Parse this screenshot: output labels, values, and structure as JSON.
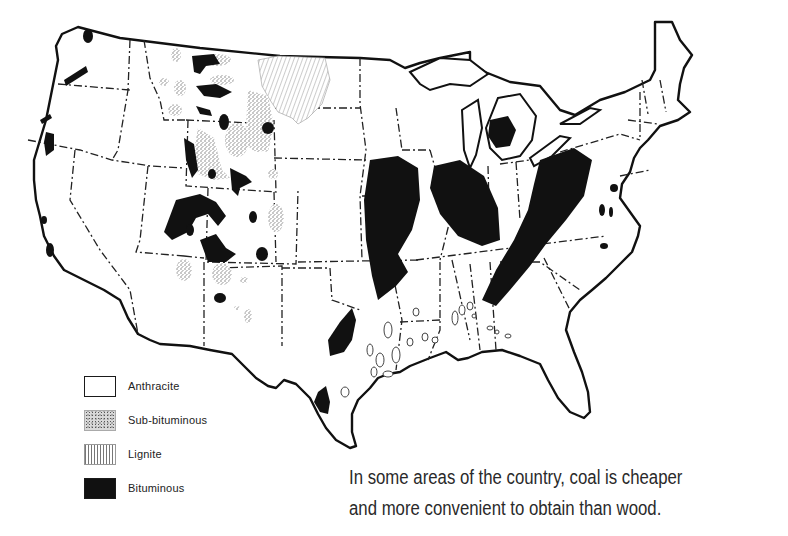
{
  "map": {
    "subject": "Coal deposits of the contiguous United States",
    "colors": {
      "background": "#ffffff",
      "outline": "#111111",
      "bituminous": "#111111",
      "sub_bituminous": "#9a9a9a",
      "lignite": "#b0b0b0",
      "anthracite": "#ffffff"
    }
  },
  "legend": {
    "items": [
      {
        "key": "anthracite",
        "label": "Anthracite",
        "icon": "white-box-swatch"
      },
      {
        "key": "sub-bituminous",
        "label": "Sub-bituminous",
        "icon": "stippled-swatch"
      },
      {
        "key": "lignite",
        "label": "Lignite",
        "icon": "vertical-hatch-swatch"
      },
      {
        "key": "bituminous",
        "label": "Bituminous",
        "icon": "solid-black-swatch"
      }
    ]
  },
  "caption": {
    "line1": "In some areas of the country, coal is cheaper",
    "line2": "and more convenient to obtain than wood."
  }
}
